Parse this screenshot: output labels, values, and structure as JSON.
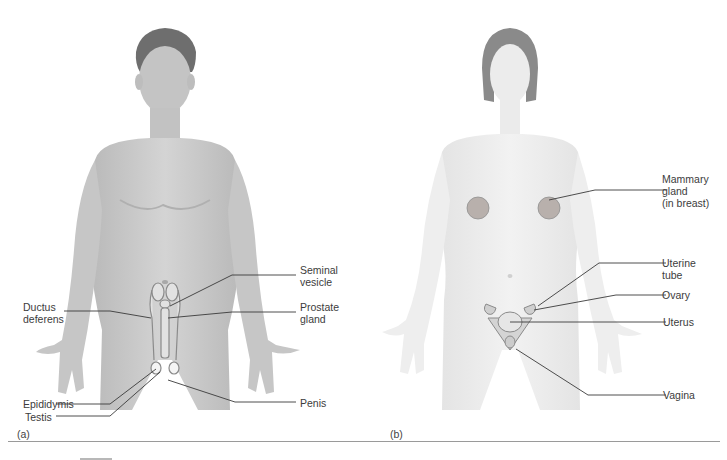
{
  "figure": {
    "panels": [
      {
        "id": "a",
        "letter": "(a)",
        "subject": "male",
        "labels": [
          {
            "text": "Seminal\nvesicle"
          },
          {
            "text": "Ductus\ndeferens"
          },
          {
            "text": "Prostate\ngland"
          },
          {
            "text": "Epididymis"
          },
          {
            "text": "Testis"
          },
          {
            "text": "Penis"
          }
        ]
      },
      {
        "id": "b",
        "letter": "(b)",
        "subject": "female",
        "labels": [
          {
            "text": "Mammary\ngland\n(in breast)"
          },
          {
            "text": "Uterine\ntube"
          },
          {
            "text": "Ovary"
          },
          {
            "text": "Uterus"
          },
          {
            "text": "Vagina"
          }
        ]
      }
    ],
    "colors": {
      "male_skin": "#c9c9c9",
      "female_skin": "#ececec",
      "leader_line": "#3a3a3a",
      "organ": "#d8d8d8"
    }
  }
}
